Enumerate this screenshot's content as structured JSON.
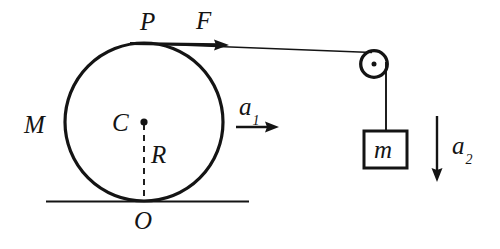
{
  "diagram": {
    "colors": {
      "ink": "#141414",
      "background": "#ffffff"
    },
    "labels": {
      "contact_point_top": "P",
      "applied_force": "F",
      "cylinder_mass": "M",
      "center": "C",
      "radius": "R",
      "contact_point_ground": "O",
      "cylinder_acceleration": "a",
      "cylinder_acceleration_sub": "1",
      "hanging_mass": "m",
      "hanging_acceleration": "a",
      "hanging_acceleration_sub": "2"
    },
    "geometry": {
      "cylinder": {
        "cx": 144,
        "cy": 122,
        "r": 79
      },
      "ground_line": {
        "x1": 46,
        "y1": 201,
        "x2": 249,
        "y2": 201
      },
      "radius_dashed": {
        "x1": 144,
        "y1": 122,
        "x2": 144,
        "y2": 201
      },
      "center_dot": {
        "cx": 144,
        "cy": 122,
        "r": 3.4
      },
      "force_arrow": {
        "x1": 132,
        "y1": 44,
        "x2": 226,
        "y2": 44
      },
      "rope_top": {
        "x1": 144,
        "y1": 43,
        "x2": 373,
        "y2": 52
      },
      "pulley": {
        "cx": 374,
        "cy": 64,
        "r": 13.5,
        "axle_r": 2.6
      },
      "rope_vertical": {
        "x1": 385,
        "y1": 62,
        "x2": 385,
        "y2": 131
      },
      "block": {
        "x": 363,
        "y": 131,
        "w": 43,
        "h": 37
      },
      "accel_arrow_1": {
        "x1": 236,
        "y1": 127,
        "x2": 277,
        "y2": 127
      },
      "accel_arrow_2": {
        "x1": 437,
        "y1": 117,
        "x2": 437,
        "y2": 181
      }
    }
  }
}
